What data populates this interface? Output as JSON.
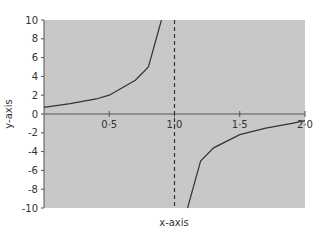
{
  "chart_data": {
    "type": "line",
    "title": "",
    "xlabel": "x-axis",
    "ylabel": "y-axis",
    "xlim": [
      0,
      2.0
    ],
    "ylim": [
      -10,
      10
    ],
    "x_ticks": [
      "0·5",
      "1·0",
      "1·5",
      "2·0"
    ],
    "y_ticks": [
      "10",
      "8",
      "6",
      "4",
      "2",
      "0",
      "-2",
      "-4",
      "-6",
      "-8",
      "-10"
    ],
    "asymptote": {
      "x": 1.0,
      "style": "dashed"
    },
    "grid": false,
    "background": "#c8c8c8",
    "series": [
      {
        "name": "y = 1/(1-x)",
        "segments": [
          {
            "x": [
              0,
              0.2,
              0.4,
              0.5,
              0.6,
              0.7,
              0.8,
              0.9
            ],
            "y": [
              0.7,
              1.1,
              1.6,
              2,
              2.8,
              3.6,
              5,
              10
            ]
          },
          {
            "x": [
              1.1,
              1.2,
              1.3,
              1.5,
              1.7,
              1.9,
              2.0
            ],
            "y": [
              -10,
              -5,
              -3.6,
              -2.2,
              -1.5,
              -1.0,
              -0.7
            ]
          }
        ]
      }
    ]
  }
}
